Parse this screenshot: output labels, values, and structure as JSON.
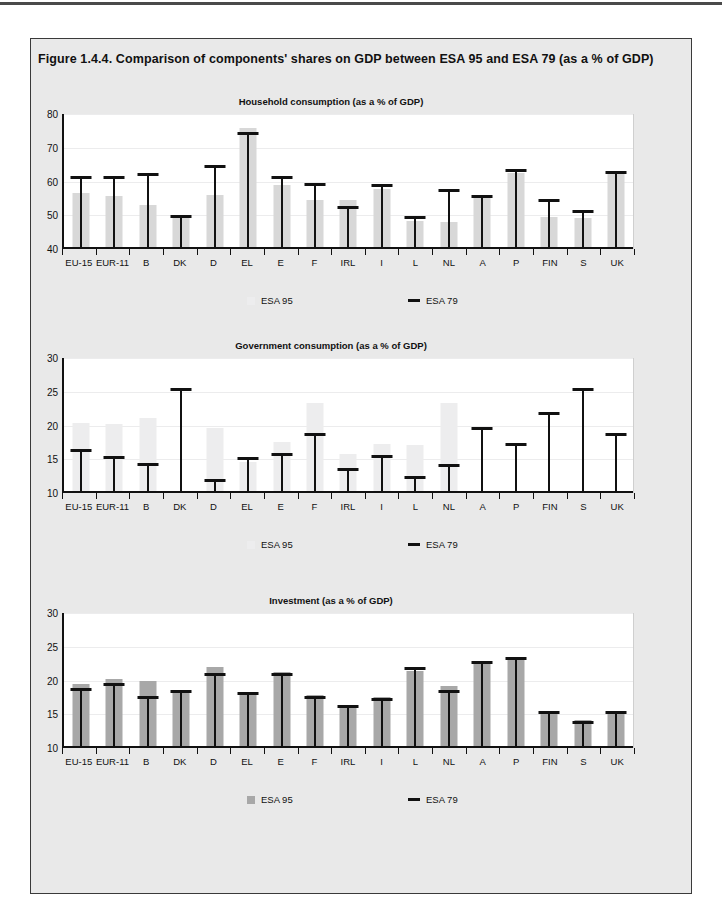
{
  "figure": {
    "title": "Figure 1.4.4. Comparison of components' shares on GDP between ESA 95 and ESA 79 (as a % of GDP)"
  },
  "legend": {
    "esa95_label": "ESA 95",
    "esa79_label": "ESA 79",
    "esa95_color_light": "#ededee",
    "esa95_color_mid": "#d8d8d8",
    "esa95_color_dark": "#a8a8a8",
    "esa79_color": "#111111"
  },
  "categories": [
    "EU-15",
    "EUR-11",
    "B",
    "DK",
    "D",
    "EL",
    "E",
    "F",
    "IRL",
    "I",
    "L",
    "NL",
    "A",
    "P",
    "FIN",
    "S",
    "UK"
  ],
  "chart_data": [
    {
      "type": "bar",
      "title": "Household consumption (as a % of GDP)",
      "xlabel": "",
      "ylabel": "",
      "ylim": [
        40,
        80
      ],
      "yticks": [
        40,
        50,
        60,
        70,
        80
      ],
      "grid": true,
      "legend_position": "below",
      "categories": [
        "EU-15",
        "EUR-11",
        "B",
        "DK",
        "D",
        "EL",
        "E",
        "F",
        "IRL",
        "I",
        "L",
        "NL",
        "A",
        "P",
        "FIN",
        "S",
        "UK"
      ],
      "series": [
        {
          "name": "ESA 95",
          "type": "bar",
          "values": [
            56.7,
            55.7,
            53.0,
            49.8,
            55.9,
            75.9,
            59.0,
            54.5,
            54.6,
            57.7,
            48.3,
            48.0,
            55.3,
            62.6,
            49.5,
            49.3,
            62.9
          ]
        },
        {
          "name": "ESA 79",
          "type": "marker",
          "values": [
            61.3,
            61.3,
            62.2,
            49.9,
            64.6,
            74.4,
            61.4,
            59.3,
            52.4,
            58.9,
            49.5,
            57.5,
            55.6,
            63.4,
            54.5,
            51.3,
            62.9
          ]
        }
      ]
    },
    {
      "type": "bar",
      "title": "Government consumption (as a % of GDP)",
      "xlabel": "",
      "ylabel": "",
      "ylim": [
        10,
        30
      ],
      "yticks": [
        10,
        15,
        20,
        25,
        30
      ],
      "grid": true,
      "legend_position": "below",
      "categories": [
        "EU-15",
        "EUR-11",
        "B",
        "DK",
        "D",
        "EL",
        "E",
        "F",
        "IRL",
        "I",
        "L",
        "NL",
        "A",
        "P",
        "FIN",
        "S",
        "UK"
      ],
      "series": [
        {
          "name": "ESA 95",
          "type": "bar",
          "values": [
            20.3,
            20.2,
            21.1,
            10.0,
            19.6,
            14.6,
            17.6,
            23.4,
            15.8,
            17.2,
            17.1,
            23.4,
            10.0,
            10.0,
            10.0,
            10.0,
            10.0
          ]
        },
        {
          "name": "ESA 79",
          "type": "marker",
          "values": [
            16.4,
            15.3,
            14.3,
            25.4,
            11.9,
            15.2,
            15.8,
            18.7,
            13.6,
            15.5,
            12.3,
            14.1,
            19.7,
            17.2,
            21.8,
            25.4,
            18.8
          ]
        }
      ]
    },
    {
      "type": "bar",
      "title": "Investment (as a % of GDP)",
      "xlabel": "",
      "ylabel": "",
      "ylim": [
        10,
        30
      ],
      "yticks": [
        10,
        15,
        20,
        25,
        30
      ],
      "grid": true,
      "legend_position": "below",
      "categories": [
        "EU-15",
        "EUR-11",
        "B",
        "DK",
        "D",
        "EL",
        "E",
        "F",
        "IRL",
        "I",
        "L",
        "NL",
        "A",
        "P",
        "FIN",
        "S",
        "UK"
      ],
      "series": [
        {
          "name": "ESA 95",
          "type": "bar",
          "values": [
            19.5,
            20.2,
            19.9,
            18.4,
            22.0,
            18.1,
            21.3,
            17.9,
            16.3,
            17.6,
            21.4,
            19.2,
            22.5,
            23.4,
            15.5,
            14.1,
            15.5
          ]
        },
        {
          "name": "ESA 79",
          "type": "marker",
          "values": [
            18.8,
            19.5,
            17.5,
            18.4,
            20.9,
            18.1,
            20.9,
            17.5,
            16.2,
            17.3,
            21.9,
            18.5,
            22.8,
            23.4,
            15.3,
            13.9,
            15.4
          ]
        }
      ]
    }
  ]
}
